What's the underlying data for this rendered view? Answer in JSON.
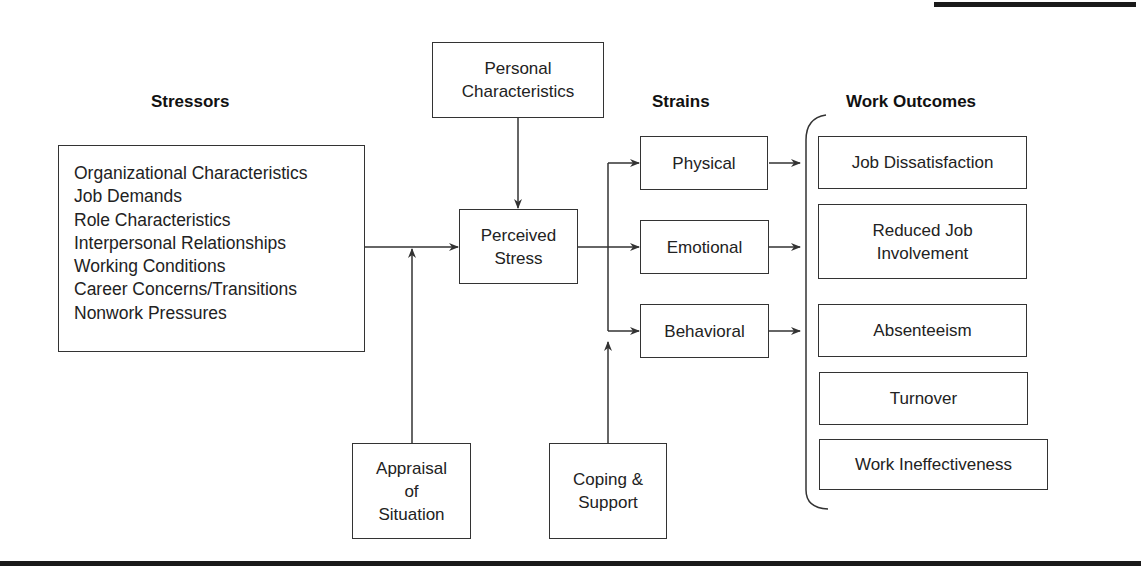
{
  "headers": {
    "stressors": "Stressors",
    "strains": "Strains",
    "outcomes": "Work Outcomes"
  },
  "stressors": [
    "Organizational Characteristics",
    "Job Demands",
    "Role Characteristics",
    "Interpersonal Relationships",
    "Working Conditions",
    "Career Concerns/Transitions",
    "Nonwork Pressures"
  ],
  "moderators": {
    "personal": [
      "Personal",
      "Characteristics"
    ],
    "appraisal": [
      "Appraisal",
      "of",
      "Situation"
    ],
    "coping": [
      "Coping &",
      "Support"
    ]
  },
  "perceived": [
    "Perceived",
    "Stress"
  ],
  "strains": [
    "Physical",
    "Emotional",
    "Behavioral"
  ],
  "outcomes": [
    [
      "Job Dissatisfaction"
    ],
    [
      "Reduced Job",
      "Involvement"
    ],
    [
      "Absenteeism"
    ],
    [
      "Turnover"
    ],
    [
      "Work Ineffectiveness"
    ]
  ],
  "colors": {
    "line": "#333333",
    "bar": "#1a1a1a"
  }
}
